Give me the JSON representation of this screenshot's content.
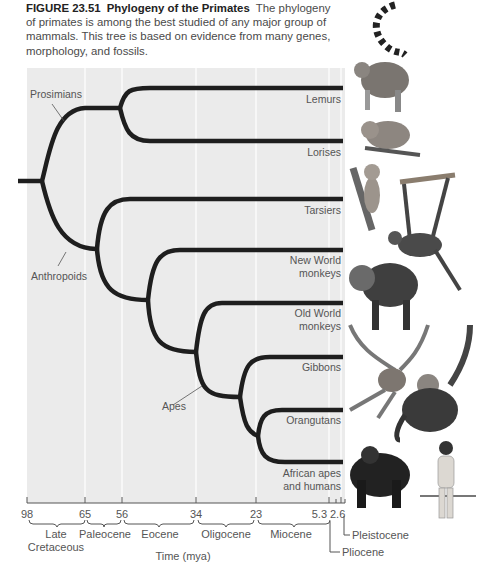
{
  "caption": {
    "figure_number": "FIGURE 23.51",
    "title": "Phylogeny of the Primates",
    "text": "The phylogeny of primates is among the best studied of any major group of mammals. This tree is based on evidence from many genes, morphology, and fossils."
  },
  "clade_labels": {
    "prosimians": "Prosimians",
    "anthropoids": "Anthropoids",
    "apes": "Apes"
  },
  "taxa": [
    {
      "line1": "Lemurs",
      "line2": ""
    },
    {
      "line1": "Lorises",
      "line2": ""
    },
    {
      "line1": "Tarsiers",
      "line2": ""
    },
    {
      "line1": "New World",
      "line2": "monkeys"
    },
    {
      "line1": "Old World",
      "line2": "monkeys"
    },
    {
      "line1": "Gibbons",
      "line2": ""
    },
    {
      "line1": "Orangutans",
      "line2": ""
    },
    {
      "line1": "African apes",
      "line2": "and humans"
    }
  ],
  "time_axis": {
    "ticks": [
      "98",
      "65",
      "56",
      "34",
      "23",
      "5.3",
      "2.6"
    ],
    "epochs": [
      {
        "line1": "Late",
        "line2": "Cretaceous"
      },
      {
        "line1": "Paleocene",
        "line2": ""
      },
      {
        "line1": "Eocene",
        "line2": ""
      },
      {
        "line1": "Oligocene",
        "line2": ""
      },
      {
        "line1": "Miocene",
        "line2": ""
      }
    ],
    "callouts": {
      "pleistocene": "Pleistocene",
      "pliocene": "Pliocene"
    },
    "label": "Time (mya)"
  },
  "illustrations": [
    "ring-tailed lemur",
    "slow loris",
    "tarsier",
    "spider monkey",
    "mandrill",
    "gibbon",
    "orangutan",
    "gorilla",
    "human"
  ],
  "colors": {
    "panel": "#ebebeb",
    "branch": "#1e1e1e",
    "text": "#555555"
  }
}
